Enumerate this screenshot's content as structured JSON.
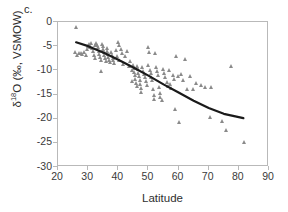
{
  "panel": {
    "label": "c."
  },
  "chart_data": {
    "type": "scatter",
    "title": "",
    "xlabel": "Latitude",
    "ylabel": "δ18O (‰, VSMOW)",
    "ylabel_parts": {
      "prefix": "δ",
      "sup": "18",
      "rest": "O (‰, VSMOW)"
    },
    "xlim": [
      20,
      90
    ],
    "ylim": [
      -30,
      0
    ],
    "xticks": [
      20,
      30,
      40,
      50,
      60,
      70,
      80,
      90
    ],
    "yticks": [
      0,
      -5,
      -10,
      -15,
      -20,
      -25,
      -30
    ],
    "grid": false,
    "legend": null,
    "marker": {
      "shape": "triangle",
      "color": "#8a8a8a",
      "size": 5
    },
    "series": [
      {
        "name": "δ18O samples",
        "points": [
          [
            26.2,
            -1.1
          ],
          [
            26.0,
            -6.3
          ],
          [
            26.6,
            -6.9
          ],
          [
            27.2,
            -6.5
          ],
          [
            27.8,
            -6.4
          ],
          [
            28.3,
            -6.6
          ],
          [
            28.9,
            -6.2
          ],
          [
            29.4,
            -6.8
          ],
          [
            29.9,
            -5.6
          ],
          [
            30.3,
            -5.0
          ],
          [
            30.6,
            -4.6
          ],
          [
            30.9,
            -5.2
          ],
          [
            31.2,
            -4.4
          ],
          [
            31.5,
            -5.5
          ],
          [
            31.8,
            -6.1
          ],
          [
            32.1,
            -6.8
          ],
          [
            32.4,
            -7.4
          ],
          [
            32.6,
            -4.9
          ],
          [
            32.9,
            -4.3
          ],
          [
            33.2,
            -4.7
          ],
          [
            33.5,
            -5.3
          ],
          [
            33.7,
            -6.0
          ],
          [
            33.9,
            -6.6
          ],
          [
            34.1,
            -7.2
          ],
          [
            34.3,
            -7.8
          ],
          [
            34.5,
            -10.2
          ],
          [
            34.8,
            -4.5
          ],
          [
            35.0,
            -5.1
          ],
          [
            35.2,
            -5.7
          ],
          [
            35.4,
            -6.3
          ],
          [
            35.6,
            -6.9
          ],
          [
            35.8,
            -7.5
          ],
          [
            36.0,
            -8.1
          ],
          [
            36.3,
            -5.4
          ],
          [
            36.5,
            -6.0
          ],
          [
            36.7,
            -6.6
          ],
          [
            36.9,
            -7.2
          ],
          [
            37.1,
            -7.8
          ],
          [
            37.4,
            -8.4
          ],
          [
            37.7,
            -6.2
          ],
          [
            38.0,
            -6.8
          ],
          [
            38.3,
            -7.4
          ],
          [
            38.6,
            -8.0
          ],
          [
            38.9,
            -8.6
          ],
          [
            39.3,
            -5.9
          ],
          [
            39.7,
            -7.1
          ],
          [
            40.1,
            -4.1
          ],
          [
            40.3,
            -4.8
          ],
          [
            40.6,
            -7.9
          ],
          [
            41.0,
            -5.6
          ],
          [
            41.4,
            -6.4
          ],
          [
            41.9,
            -8.8
          ],
          [
            42.4,
            -7.0
          ],
          [
            43.0,
            -6.1
          ],
          [
            43.6,
            -9.1
          ],
          [
            44.1,
            -8.2
          ],
          [
            44.6,
            -10.0
          ],
          [
            44.9,
            -12.2
          ],
          [
            45.1,
            -9.0
          ],
          [
            45.3,
            -9.6
          ],
          [
            45.5,
            -10.4
          ],
          [
            45.7,
            -11.1
          ],
          [
            45.9,
            -11.8
          ],
          [
            46.1,
            -12.6
          ],
          [
            46.3,
            -13.3
          ],
          [
            46.5,
            -9.2
          ],
          [
            46.7,
            -9.8
          ],
          [
            46.9,
            -10.5
          ],
          [
            47.1,
            -11.2
          ],
          [
            47.3,
            -12.0
          ],
          [
            47.5,
            -12.8
          ],
          [
            47.7,
            -13.6
          ],
          [
            47.9,
            -14.6
          ],
          [
            48.2,
            -9.4
          ],
          [
            48.5,
            -10.1
          ],
          [
            48.8,
            -10.8
          ],
          [
            49.1,
            -11.5
          ],
          [
            49.4,
            -12.3
          ],
          [
            49.7,
            -13.0
          ],
          [
            50.0,
            -9.0
          ],
          [
            50.2,
            -5.3
          ],
          [
            50.4,
            -6.2
          ],
          [
            50.6,
            -9.9
          ],
          [
            50.9,
            -10.6
          ],
          [
            51.2,
            -11.4
          ],
          [
            51.5,
            -12.1
          ],
          [
            51.8,
            -13.9
          ],
          [
            52.0,
            -15.1
          ],
          [
            52.2,
            -16.0
          ],
          [
            52.4,
            -6.4
          ],
          [
            52.7,
            -9.3
          ],
          [
            53.0,
            -10.2
          ],
          [
            53.3,
            -11.0
          ],
          [
            53.6,
            -13.5
          ],
          [
            53.9,
            -14.8
          ],
          [
            54.2,
            -15.6
          ],
          [
            54.6,
            -16.2
          ],
          [
            55.0,
            -9.8
          ],
          [
            55.4,
            -10.6
          ],
          [
            55.8,
            -11.5
          ],
          [
            56.2,
            -12.4
          ],
          [
            56.6,
            -13.2
          ],
          [
            57.0,
            -9.9
          ],
          [
            57.4,
            -12.8
          ],
          [
            57.8,
            -13.6
          ],
          [
            58.2,
            -11.1
          ],
          [
            58.6,
            -11.9
          ],
          [
            59.0,
            -18.0
          ],
          [
            59.5,
            -7.0
          ],
          [
            60.0,
            -11.2
          ],
          [
            60.4,
            -20.8
          ],
          [
            61.0,
            -10.8
          ],
          [
            61.6,
            -12.0
          ],
          [
            62.2,
            -7.6
          ],
          [
            63.0,
            -14.0
          ],
          [
            64.0,
            -11.3
          ],
          [
            65.0,
            -13.9
          ],
          [
            66.0,
            -12.7
          ],
          [
            67.5,
            -13.1
          ],
          [
            69.0,
            -13.5
          ],
          [
            70.5,
            -19.6
          ],
          [
            71.0,
            -13.5
          ],
          [
            74.5,
            -20.6
          ],
          [
            76.0,
            -22.4
          ],
          [
            77.5,
            -9.1
          ],
          [
            81.8,
            -24.8
          ]
        ]
      }
    ],
    "trendline": {
      "description": "downward-curving fitted polynomial trend",
      "color": "#1a1a1a",
      "width": 2.2,
      "points": [
        [
          26.0,
          -4.2
        ],
        [
          30.0,
          -5.0
        ],
        [
          35.0,
          -6.3
        ],
        [
          40.0,
          -7.8
        ],
        [
          45.0,
          -9.4
        ],
        [
          50.0,
          -11.1
        ],
        [
          55.0,
          -12.9
        ],
        [
          60.0,
          -14.6
        ],
        [
          65.0,
          -16.3
        ],
        [
          70.0,
          -17.8
        ],
        [
          75.0,
          -19.0
        ],
        [
          81.5,
          -19.9
        ]
      ]
    }
  }
}
